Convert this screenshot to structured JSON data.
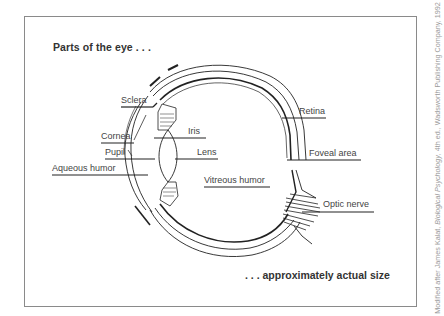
{
  "diagram": {
    "title": "Parts of the eye . . .",
    "footer": ". . . approximately actual size",
    "credit": {
      "prefix": "Modified after James Kalat, ",
      "book": "Biological Psychology",
      "suffix": ", 4th ed., Wadsworth Publishing Company, 1992"
    },
    "labels": {
      "sclera": "Sclera",
      "cornea": "Cornea",
      "iris": "Iris",
      "pupil": "Pupil",
      "lens": "Lens",
      "aqueous_humor": "Aqueous humor",
      "vitreous_humor": "Vitreous humor",
      "retina": "Retina",
      "foveal_area": "Foveal area",
      "optic_nerve": "Optic nerve"
    },
    "colors": {
      "line": "#222222",
      "label_text": "#444444",
      "frame": "#8a8a8a",
      "credit_text": "#9a9a9a"
    }
  }
}
